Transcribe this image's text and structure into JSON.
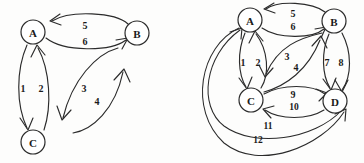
{
  "figure": {
    "background_color": "#fdfdfc",
    "ink_color": "#2b2b2b",
    "panels": [
      {
        "id": "left",
        "name": "three-node-directed-graph",
        "nodes": [
          {
            "id": "A",
            "label": "A",
            "cx": 33,
            "cy": 32,
            "r": 12
          },
          {
            "id": "B",
            "label": "B",
            "cx": 137,
            "cy": 33,
            "r": 12
          },
          {
            "id": "C",
            "label": "C",
            "cx": 33,
            "cy": 142,
            "r": 12
          }
        ],
        "edges": [
          {
            "id": "e1",
            "label": "1",
            "from": "A",
            "to": "C",
            "lx": 23,
            "ly": 88
          },
          {
            "id": "e2",
            "label": "2",
            "from": "C",
            "to": "A",
            "lx": 41,
            "ly": 88
          },
          {
            "id": "e3",
            "label": "3",
            "from": "B",
            "to": "C",
            "lx": 84,
            "ly": 88
          },
          {
            "id": "e4",
            "label": "4",
            "from": "C",
            "to": "B",
            "lx": 97,
            "ly": 101
          },
          {
            "id": "e5",
            "label": "5",
            "from": "B",
            "to": "A",
            "lx": 85,
            "ly": 25
          },
          {
            "id": "e6",
            "label": "6",
            "from": "A",
            "to": "B",
            "lx": 85,
            "ly": 41
          }
        ]
      },
      {
        "id": "right",
        "name": "four-node-directed-graph",
        "nodes": [
          {
            "id": "A",
            "label": "A",
            "cx": 68,
            "cy": 20,
            "r": 12
          },
          {
            "id": "B",
            "label": "B",
            "cx": 152,
            "cy": 21,
            "r": 12
          },
          {
            "id": "C",
            "label": "C",
            "cx": 69,
            "cy": 100,
            "r": 12
          },
          {
            "id": "D",
            "label": "D",
            "cx": 153,
            "cy": 101,
            "r": 12
          }
        ],
        "edges": [
          {
            "id": "e1",
            "label": "1",
            "from": "A",
            "to": "C",
            "lx": 61,
            "ly": 62
          },
          {
            "id": "e2",
            "label": "2",
            "from": "C",
            "to": "A",
            "lx": 76,
            "ly": 62
          },
          {
            "id": "e3",
            "label": "3",
            "from": "B",
            "to": "C",
            "lx": 105,
            "ly": 56
          },
          {
            "id": "e4",
            "label": "4",
            "from": "C",
            "to": "B",
            "lx": 114,
            "ly": 67
          },
          {
            "id": "e5",
            "label": "5",
            "from": "B",
            "to": "A",
            "lx": 111,
            "ly": 13
          },
          {
            "id": "e6",
            "label": "6",
            "from": "A",
            "to": "B",
            "lx": 111,
            "ly": 26
          },
          {
            "id": "e7",
            "label": "7",
            "from": "B",
            "to": "D",
            "lx": 145,
            "ly": 62
          },
          {
            "id": "e8",
            "label": "8",
            "from": "D",
            "to": "B",
            "lx": 159,
            "ly": 62
          },
          {
            "id": "e9",
            "label": "9",
            "from": "C",
            "to": "D",
            "lx": 111,
            "ly": 94
          },
          {
            "id": "e10",
            "label": "10",
            "from": "D",
            "to": "C",
            "lx": 112,
            "ly": 107
          },
          {
            "id": "e11",
            "label": "11",
            "from": "D",
            "to": "A",
            "lx": 86,
            "ly": 126
          },
          {
            "id": "e12",
            "label": "12",
            "from": "A",
            "to": "D",
            "lx": 76,
            "ly": 140
          }
        ]
      }
    ]
  }
}
